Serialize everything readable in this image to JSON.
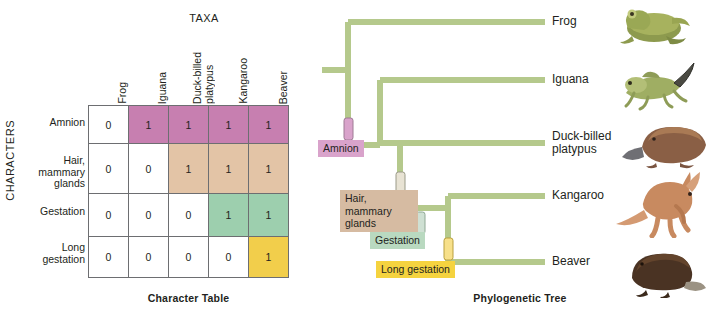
{
  "figure": {
    "left_caption": "Character Table",
    "right_caption": "Phylogenetic Tree"
  },
  "character_table": {
    "taxa_axis_label": "TAXA",
    "characters_axis_label": "CHARACTERS",
    "columns": [
      "Frog",
      "Iguana",
      "Duck-billed\nplatypus",
      "Kangaroo",
      "Beaver"
    ],
    "rows": [
      {
        "label": "Amnion",
        "color": "#c druid",
        "values": [
          "0",
          "1",
          "1",
          "1",
          "1"
        ],
        "highlight_color": "#c77fb0",
        "highlight_from_index": 1
      },
      {
        "label": "Hair,\nmammary\nglands",
        "values": [
          "0",
          "0",
          "1",
          "1",
          "1"
        ],
        "highlight_color": "#e3c4a6",
        "highlight_from_index": 2
      },
      {
        "label": "Gestation",
        "values": [
          "0",
          "0",
          "0",
          "1",
          "1"
        ],
        "highlight_color": "#9dcfae",
        "highlight_from_index": 3
      },
      {
        "label": "Long\ngestation",
        "values": [
          "0",
          "0",
          "0",
          "0",
          "1"
        ],
        "highlight_color": "#f2ce4b",
        "highlight_from_index": 4
      }
    ]
  },
  "tree": {
    "branch_color": "#b5c98c",
    "tips": [
      {
        "label": "Frog",
        "animal": "frog-illustration"
      },
      {
        "label": "Iguana",
        "animal": "iguana-illustration"
      },
      {
        "label": "Duck-billed\nplatypus",
        "animal": "platypus-illustration"
      },
      {
        "label": "Kangaroo",
        "animal": "kangaroo-illustration"
      },
      {
        "label": "Beaver",
        "animal": "beaver-illustration"
      }
    ],
    "traits": [
      {
        "label": "Amnion",
        "color": "#d9a3cb",
        "marker_color": "#c77fb0"
      },
      {
        "label": "Hair,\nmammary\nglands",
        "color": "#d6bba2",
        "marker_color": "#e3c4a6"
      },
      {
        "label": "Gestation",
        "color": "#b9d9c0",
        "marker_color": "#9dcfae"
      },
      {
        "label": "Long gestation",
        "color": "#f5d33f",
        "marker_color": "#f2ce4b"
      }
    ]
  }
}
